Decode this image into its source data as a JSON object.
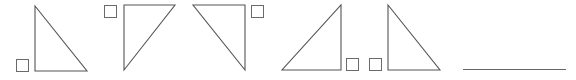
{
  "worksheet": {
    "colors": {
      "background": "#ffffff",
      "stroke": "#555555",
      "checkbox_stroke": "#6a6a6a",
      "answer_line": "#666666"
    },
    "options": [
      {
        "id": "triangle-1",
        "right_angle": "bottom-left",
        "points": [
          [
            35,
            6
          ],
          [
            35,
            71
          ],
          [
            87,
            71
          ]
        ],
        "checkbox": {
          "x": 16,
          "y": 59,
          "size": 12,
          "position": "bottom-left",
          "checked": false
        }
      },
      {
        "id": "triangle-2",
        "right_angle": "top-left",
        "points": [
          [
            124,
            5
          ],
          [
            175,
            5
          ],
          [
            124,
            70
          ]
        ],
        "checkbox": {
          "x": 104,
          "y": 5,
          "size": 12,
          "position": "top-left",
          "checked": false
        }
      },
      {
        "id": "triangle-3",
        "right_angle": "top-right",
        "points": [
          [
            193,
            5
          ],
          [
            245,
            5
          ],
          [
            245,
            70
          ]
        ],
        "checkbox": {
          "x": 251,
          "y": 5,
          "size": 12,
          "position": "top-right",
          "checked": false
        }
      },
      {
        "id": "triangle-4",
        "right_angle": "bottom-right",
        "points": [
          [
            341,
            5
          ],
          [
            341,
            70
          ],
          [
            282,
            70
          ]
        ],
        "checkbox": {
          "x": 346,
          "y": 58,
          "size": 12,
          "position": "bottom-right",
          "checked": false
        }
      },
      {
        "id": "triangle-5",
        "right_angle": "bottom-left",
        "points": [
          [
            388,
            5
          ],
          [
            388,
            70
          ],
          [
            440,
            70
          ]
        ],
        "checkbox": {
          "x": 369,
          "y": 58,
          "size": 12,
          "position": "bottom-left",
          "checked": false
        }
      }
    ],
    "answer_line": {
      "x1": 463,
      "y1": 69,
      "x2": 566,
      "y2": 69,
      "value": ""
    }
  }
}
